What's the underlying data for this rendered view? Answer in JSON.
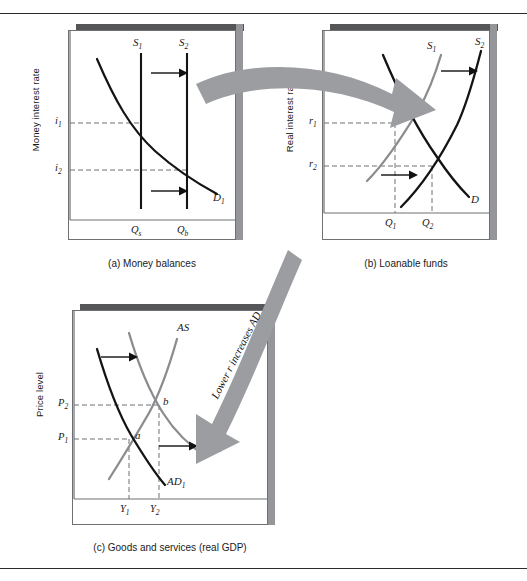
{
  "figure": {
    "type": "economics-diagram",
    "arrow_text": "Lower r increases AD",
    "colors": {
      "black_curve": "#141414",
      "gray_curve": "#8a8c8f",
      "panel_shadow_top": "#555658",
      "panel_shadow_right": "#949699",
      "panel_border": "#6f7072",
      "big_arrow": "#9b9da0",
      "dashed": "#6f7072",
      "page_rule": "#2b2b2b"
    }
  },
  "panels": [
    {
      "id": "a",
      "caption": "(a) Money balances",
      "ylabel": "Money interest rate",
      "yticks": [
        {
          "label": "i",
          "sub": "1"
        },
        {
          "label": "i",
          "sub": "2"
        }
      ],
      "xticks": [
        {
          "label": "Q",
          "sub": "s"
        },
        {
          "label": "Q",
          "sub": "b"
        }
      ],
      "curves": [
        {
          "name": "S",
          "sub": "1",
          "kind": "vertical-supply",
          "color": "#141414"
        },
        {
          "name": "S",
          "sub": "2",
          "kind": "vertical-supply",
          "color": "#141414"
        },
        {
          "name": "D",
          "sub": "1",
          "kind": "demand",
          "color": "#141414"
        }
      ],
      "shift_arrows": 2
    },
    {
      "id": "b",
      "caption": "(b) Loanable funds",
      "ylabel": "Real interest rate",
      "yticks": [
        {
          "label": "r",
          "sub": "1"
        },
        {
          "label": "r",
          "sub": "2"
        }
      ],
      "xticks": [
        {
          "label": "Q",
          "sub": "1"
        },
        {
          "label": "Q",
          "sub": "2"
        }
      ],
      "curves": [
        {
          "name": "S",
          "sub": "1",
          "kind": "supply",
          "color": "#8a8c8f"
        },
        {
          "name": "S",
          "sub": "2",
          "kind": "supply",
          "color": "#141414"
        },
        {
          "name": "D",
          "sub": "",
          "kind": "demand",
          "color": "#141414"
        }
      ],
      "shift_arrows": 2
    },
    {
      "id": "c",
      "caption": "(c) Goods and services (real GDP)",
      "ylabel": "Price level",
      "yticks": [
        {
          "label": "P",
          "sub": "2"
        },
        {
          "label": "P",
          "sub": "1"
        }
      ],
      "xticks": [
        {
          "label": "Y",
          "sub": "1"
        },
        {
          "label": "Y",
          "sub": "2"
        }
      ],
      "curves": [
        {
          "name": "AS",
          "sub": "",
          "kind": "supply",
          "color": "#8a8c8f"
        },
        {
          "name": "AD",
          "sub": "1",
          "kind": "demand",
          "color": "#141414"
        },
        {
          "name": "AD",
          "sub": "2",
          "kind": "demand",
          "color": "#8a8c8f"
        }
      ],
      "equilibria": [
        {
          "label": "a"
        },
        {
          "label": "b"
        }
      ],
      "shift_arrows": 2
    }
  ]
}
